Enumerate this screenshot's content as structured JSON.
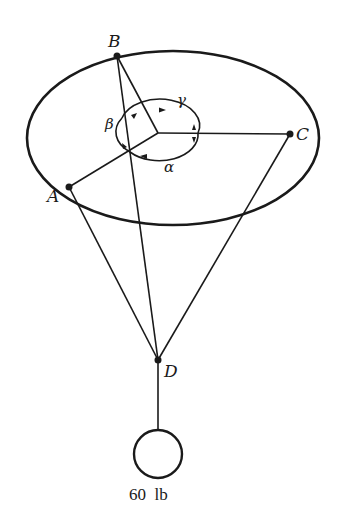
{
  "diagram": {
    "points": {
      "A": {
        "label": "A"
      },
      "B": {
        "label": "B"
      },
      "C": {
        "label": "C"
      },
      "D": {
        "label": "D"
      }
    },
    "angles": {
      "alpha": "α",
      "beta": "β",
      "gamma": "γ"
    },
    "weight": {
      "label": "60  lb"
    },
    "colors": {
      "stroke": "#1a1a1a",
      "background": "#ffffff"
    }
  }
}
